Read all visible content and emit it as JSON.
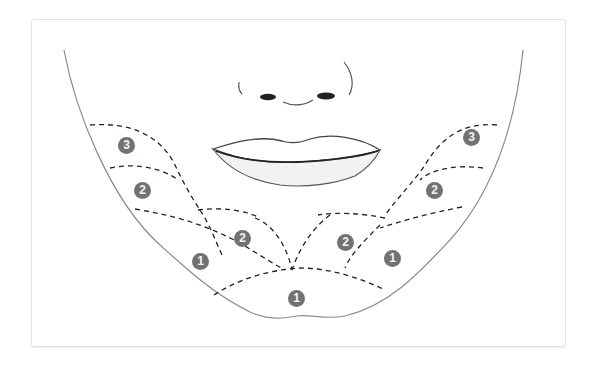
{
  "diagram": {
    "colors": {
      "badge_fill": "#727272",
      "badge_text": "#f5f5f5",
      "dash_line": "#222222",
      "outline": "#888888"
    },
    "zones": [
      {
        "id": "left-3",
        "label": "3",
        "x": 127,
        "y": 146
      },
      {
        "id": "left-2-outer",
        "label": "2",
        "x": 143,
        "y": 191
      },
      {
        "id": "left-2-inner",
        "label": "2",
        "x": 243,
        "y": 239
      },
      {
        "id": "left-1",
        "label": "1",
        "x": 201,
        "y": 262
      },
      {
        "id": "chin-1",
        "label": "1",
        "x": 297,
        "y": 299
      },
      {
        "id": "right-2-inner",
        "label": "2",
        "x": 346,
        "y": 243
      },
      {
        "id": "right-1",
        "label": "1",
        "x": 393,
        "y": 259
      },
      {
        "id": "right-2-outer",
        "label": "2",
        "x": 435,
        "y": 191
      },
      {
        "id": "right-3",
        "label": "3",
        "x": 472,
        "y": 138
      }
    ]
  }
}
